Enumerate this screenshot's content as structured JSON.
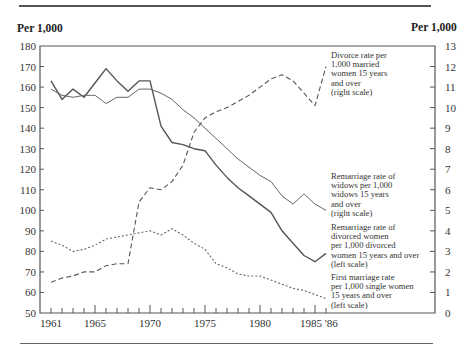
{
  "header": {
    "left_unit": "Per 1,000",
    "right_unit": "Per 1,000"
  },
  "axes": {
    "left_ticks": [
      "180",
      "170",
      "160",
      "150",
      "140",
      "130",
      "120",
      "110",
      "100",
      "90",
      "80",
      "70",
      "60",
      "50"
    ],
    "right_ticks": [
      "13",
      "12",
      "11",
      "10",
      "9",
      "8",
      "7",
      "6",
      "5",
      "4",
      "3",
      "2",
      "1",
      "0"
    ],
    "x_ticks": [
      "1961",
      "1965",
      "1970",
      "1975",
      "1980",
      "1985 '86"
    ]
  },
  "annotations": {
    "divorce": [
      "Divorce rate per",
      "1,000 married",
      "women 15 years",
      "and over",
      "(right scale)"
    ],
    "widows": [
      "Remarriage rate of",
      "widows per 1,000",
      "widows 15 years",
      "and over",
      "(right scale)"
    ],
    "divorced": [
      "Remarriage rate of",
      "divorced women",
      "per 1,000 divorced",
      "women 15 years and over",
      "(left scale)"
    ],
    "first": [
      "First marriage rate",
      "per 1,000 single women",
      "15 years and over",
      "(left scale)"
    ]
  },
  "chart_data": {
    "type": "line",
    "title": "",
    "xlabel": "",
    "ylabel": "Per 1,000",
    "ylabel_right": "Per 1,000",
    "ylim": [
      50,
      180
    ],
    "ylim_right": [
      0,
      13
    ],
    "grid": false,
    "legend_position": "inline annotations at right",
    "x": [
      1961,
      1962,
      1963,
      1964,
      1965,
      1966,
      1967,
      1968,
      1969,
      1970,
      1971,
      1972,
      1973,
      1974,
      1975,
      1976,
      1977,
      1978,
      1979,
      1980,
      1981,
      1982,
      1983,
      1984,
      1985,
      1986
    ],
    "x_tick_labels": [
      "1961",
      "1965",
      "1970",
      "1975",
      "1980",
      "1985",
      "'86"
    ],
    "series": [
      {
        "name": "Remarriage rate of divorced women per 1,000 divorced women 15 years and over (left scale)",
        "axis": "left",
        "style": "solid",
        "values": [
          163,
          154,
          159,
          155,
          162,
          169,
          163,
          158,
          163,
          163,
          141,
          133,
          132,
          130,
          129,
          122,
          116,
          111,
          107,
          103,
          99,
          90,
          84,
          78,
          75,
          79
        ]
      },
      {
        "name": "Remarriage rate of widows per 1,000 widows 15 years and over (right scale)",
        "axis": "right",
        "style": "solid-thin",
        "values": [
          10.9,
          10.6,
          10.5,
          10.6,
          10.6,
          10.2,
          10.5,
          10.5,
          10.9,
          10.9,
          10.7,
          10.4,
          9.9,
          9.5,
          9.0,
          8.5,
          8.0,
          7.5,
          7.1,
          6.7,
          6.4,
          5.7,
          5.3,
          5.8,
          5.3,
          5.0
        ]
      },
      {
        "name": "Divorce rate per 1,000 married women 15 years and over (right scale)",
        "axis": "right",
        "style": "dashed",
        "values": [
          1.5,
          1.7,
          1.8,
          2.0,
          2.0,
          2.3,
          2.4,
          2.4,
          5.4,
          6.1,
          6.0,
          6.4,
          7.2,
          8.8,
          9.5,
          9.8,
          10.0,
          10.3,
          10.6,
          11.0,
          11.4,
          11.6,
          11.3,
          10.7,
          10.1,
          12.0
        ]
      },
      {
        "name": "First marriage rate per 1,000 single women 15 years and over (left scale)",
        "axis": "left",
        "style": "dotted",
        "values": [
          85,
          83,
          80,
          81,
          83,
          86,
          87,
          88,
          89,
          90,
          88,
          91,
          88,
          84,
          81,
          74,
          72,
          69,
          68,
          68,
          66,
          64,
          62,
          61,
          59,
          57
        ]
      }
    ]
  }
}
